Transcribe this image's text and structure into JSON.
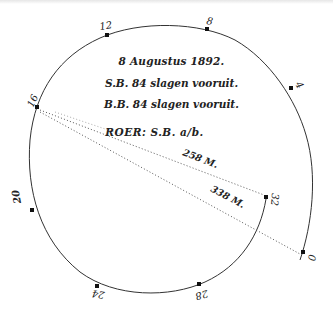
{
  "figure": {
    "caption_lines": {
      "date": "8 Augustus 1892.",
      "starboard": "S.B. 84 slagen vooruit.",
      "port": "B.B. 84 slagen vooruit.",
      "rudder": "ROER:  S.B. a/b."
    },
    "track_points": [
      {
        "label": "0",
        "x": 303,
        "y": 253
      },
      {
        "label": "4",
        "x": 291,
        "y": 88
      },
      {
        "label": "8",
        "x": 207,
        "y": 29
      },
      {
        "label": "12",
        "x": 107,
        "y": 35
      },
      {
        "label": "16",
        "x": 37,
        "y": 107
      },
      {
        "label": "20",
        "x": 32,
        "y": 210
      },
      {
        "label": "24",
        "x": 97,
        "y": 286
      },
      {
        "label": "28",
        "x": 199,
        "y": 284
      },
      {
        "label": "32",
        "x": 266,
        "y": 197
      }
    ],
    "distances": [
      {
        "label": "258 M.",
        "from": "16",
        "to": "32"
      },
      {
        "label": "338 M.",
        "from": "16",
        "to": "0"
      }
    ]
  }
}
